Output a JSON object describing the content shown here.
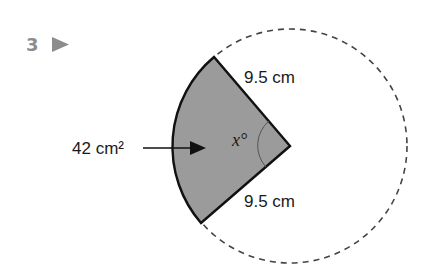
{
  "question": {
    "number": "3",
    "marker_icon": "right-triangle-icon",
    "marker_color": "#8c8c8c"
  },
  "diagram": {
    "type": "circle-sector",
    "radius_label": "9.5 cm",
    "radius_label_bottom": "9.5 cm",
    "area_label": "42 cm²",
    "angle_label": "x°",
    "sector_fill": "#9b9b9b",
    "outline_color": "#111111",
    "circle_style": "dashed"
  }
}
